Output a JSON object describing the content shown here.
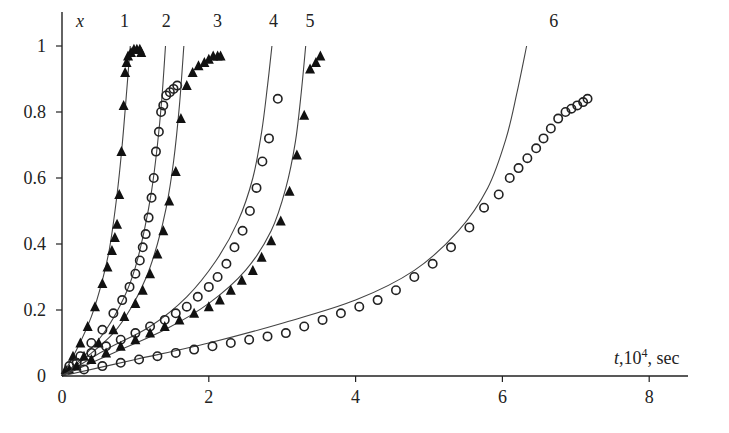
{
  "chart_data": {
    "type": "scatter",
    "title": "",
    "xlabel": "t,10^4, sec",
    "ylabel": "x",
    "xlim": [
      0,
      8.6
    ],
    "ylim": [
      0,
      1.1
    ],
    "x_ticks": [
      0,
      2,
      4,
      6,
      8
    ],
    "y_ticks": [
      0,
      0.2,
      0.4,
      0.6,
      0.8,
      1
    ],
    "x_tick_labels": [
      "0",
      "2",
      "4",
      "6",
      "8"
    ],
    "y_tick_labels": [
      "0",
      "0.2",
      "0.4",
      "0.6",
      "0.8",
      "1"
    ],
    "grid": false,
    "legend": "none (curves numbered 1-6 at top)",
    "curve_labels": [
      {
        "label": "1",
        "t": 0.85
      },
      {
        "label": "2",
        "t": 1.42
      },
      {
        "label": "3",
        "t": 2.12
      },
      {
        "label": "4",
        "t": 2.88
      },
      {
        "label": "5",
        "t": 3.38
      },
      {
        "label": "6",
        "t": 6.7
      }
    ],
    "series": [
      {
        "name": "1 (model)",
        "kind": "line",
        "x": [
          0,
          0.2,
          0.4,
          0.55,
          0.65,
          0.75,
          0.82,
          0.88,
          0.93
        ],
        "y": [
          0,
          0.08,
          0.18,
          0.29,
          0.39,
          0.55,
          0.7,
          0.86,
          1.0
        ]
      },
      {
        "name": "1 (experiment)",
        "kind": "marker",
        "marker": "triangle-filled",
        "x": [
          0.05,
          0.15,
          0.25,
          0.35,
          0.45,
          0.55,
          0.62,
          0.68,
          0.72,
          0.75,
          0.78,
          0.81,
          0.84,
          0.86,
          0.88,
          0.9,
          0.94,
          0.98,
          1.02,
          1.06,
          1.08
        ],
        "y": [
          0.02,
          0.06,
          0.1,
          0.15,
          0.21,
          0.28,
          0.33,
          0.38,
          0.42,
          0.46,
          0.55,
          0.68,
          0.82,
          0.92,
          0.95,
          0.97,
          0.98,
          0.99,
          0.99,
          0.99,
          0.98
        ]
      },
      {
        "name": "2 (model)",
        "kind": "line",
        "x": [
          0,
          0.3,
          0.6,
          0.85,
          1.0,
          1.12,
          1.22,
          1.3,
          1.36,
          1.41
        ],
        "y": [
          0,
          0.06,
          0.14,
          0.24,
          0.33,
          0.44,
          0.56,
          0.7,
          0.84,
          1.0
        ]
      },
      {
        "name": "2 (experiment)",
        "kind": "marker",
        "marker": "circle-open",
        "x": [
          0.1,
          0.25,
          0.4,
          0.55,
          0.7,
          0.82,
          0.92,
          1.0,
          1.06,
          1.1,
          1.14,
          1.18,
          1.22,
          1.25,
          1.28,
          1.32,
          1.35,
          1.38,
          1.42,
          1.47,
          1.52,
          1.57
        ],
        "y": [
          0.03,
          0.06,
          0.1,
          0.14,
          0.19,
          0.23,
          0.27,
          0.31,
          0.35,
          0.39,
          0.43,
          0.48,
          0.54,
          0.6,
          0.68,
          0.74,
          0.8,
          0.82,
          0.85,
          0.86,
          0.87,
          0.88
        ]
      },
      {
        "name": "3 (model)",
        "kind": "line",
        "x": [
          0,
          0.35,
          0.7,
          0.95,
          1.15,
          1.3,
          1.42,
          1.52,
          1.6,
          1.66
        ],
        "y": [
          0,
          0.06,
          0.13,
          0.21,
          0.3,
          0.4,
          0.51,
          0.65,
          0.82,
          1.0
        ]
      },
      {
        "name": "3 (experiment)",
        "kind": "marker",
        "marker": "triangle-filled",
        "x": [
          0.1,
          0.3,
          0.5,
          0.7,
          0.85,
          1.0,
          1.1,
          1.2,
          1.3,
          1.38,
          1.46,
          1.55,
          1.62,
          1.7,
          1.78,
          1.86,
          1.94,
          2.0,
          2.06,
          2.12,
          2.16
        ],
        "y": [
          0.02,
          0.06,
          0.1,
          0.14,
          0.18,
          0.22,
          0.26,
          0.31,
          0.37,
          0.44,
          0.53,
          0.62,
          0.78,
          0.88,
          0.92,
          0.94,
          0.95,
          0.96,
          0.97,
          0.97,
          0.97
        ]
      },
      {
        "name": "4 (model)",
        "kind": "line",
        "x": [
          0,
          0.6,
          1.2,
          1.7,
          2.1,
          2.4,
          2.6,
          2.72,
          2.8,
          2.86
        ],
        "y": [
          0,
          0.08,
          0.15,
          0.24,
          0.35,
          0.47,
          0.6,
          0.74,
          0.88,
          1.0
        ]
      },
      {
        "name": "4 (experiment)",
        "kind": "marker",
        "marker": "circle-open",
        "x": [
          0.2,
          0.4,
          0.6,
          0.8,
          1.0,
          1.2,
          1.4,
          1.55,
          1.7,
          1.85,
          2.0,
          2.12,
          2.24,
          2.35,
          2.46,
          2.56,
          2.65,
          2.73,
          2.82,
          2.94
        ],
        "y": [
          0.04,
          0.07,
          0.09,
          0.11,
          0.13,
          0.15,
          0.17,
          0.19,
          0.21,
          0.24,
          0.27,
          0.3,
          0.34,
          0.39,
          0.44,
          0.5,
          0.57,
          0.65,
          0.72,
          0.84
        ]
      },
      {
        "name": "5 (model)",
        "kind": "line",
        "x": [
          0,
          0.7,
          1.4,
          2.0,
          2.5,
          2.85,
          3.05,
          3.18,
          3.26,
          3.32
        ],
        "y": [
          0,
          0.07,
          0.14,
          0.22,
          0.32,
          0.44,
          0.57,
          0.71,
          0.86,
          1.0
        ]
      },
      {
        "name": "5 (experiment)",
        "kind": "marker",
        "marker": "triangle-filled",
        "x": [
          0.2,
          0.4,
          0.6,
          0.8,
          1.0,
          1.2,
          1.4,
          1.6,
          1.8,
          2.0,
          2.15,
          2.3,
          2.45,
          2.6,
          2.72,
          2.85,
          2.98,
          3.1,
          3.2,
          3.3,
          3.38,
          3.46,
          3.52
        ],
        "y": [
          0.03,
          0.05,
          0.07,
          0.09,
          0.11,
          0.13,
          0.15,
          0.17,
          0.19,
          0.21,
          0.23,
          0.26,
          0.29,
          0.32,
          0.36,
          0.41,
          0.47,
          0.56,
          0.67,
          0.79,
          0.93,
          0.95,
          0.97
        ]
      },
      {
        "name": "6 (model)",
        "kind": "line",
        "x": [
          0,
          1.0,
          2.0,
          3.0,
          4.0,
          4.8,
          5.4,
          5.8,
          6.05,
          6.2,
          6.33
        ],
        "y": [
          0,
          0.05,
          0.1,
          0.16,
          0.23,
          0.32,
          0.44,
          0.57,
          0.72,
          0.86,
          1.0
        ]
      },
      {
        "name": "6 (experiment)",
        "kind": "marker",
        "marker": "circle-open",
        "x": [
          0.3,
          0.55,
          0.8,
          1.05,
          1.3,
          1.55,
          1.8,
          2.05,
          2.3,
          2.55,
          2.8,
          3.05,
          3.3,
          3.55,
          3.8,
          4.05,
          4.3,
          4.55,
          4.8,
          5.05,
          5.3,
          5.55,
          5.75,
          5.95,
          6.1,
          6.22,
          6.34,
          6.46,
          6.56,
          6.66,
          6.76,
          6.86,
          6.94,
          7.02,
          7.1,
          7.16
        ],
        "y": [
          0.02,
          0.03,
          0.04,
          0.05,
          0.06,
          0.07,
          0.08,
          0.09,
          0.1,
          0.11,
          0.12,
          0.13,
          0.15,
          0.17,
          0.19,
          0.21,
          0.23,
          0.26,
          0.3,
          0.34,
          0.39,
          0.45,
          0.51,
          0.55,
          0.6,
          0.63,
          0.66,
          0.69,
          0.72,
          0.75,
          0.78,
          0.8,
          0.81,
          0.82,
          0.83,
          0.84
        ]
      }
    ]
  },
  "axes": {
    "y_title": "x",
    "x_title_var": "t",
    "x_title_rest": ",10",
    "x_title_exp": "4",
    "x_title_unit": ", sec"
  }
}
